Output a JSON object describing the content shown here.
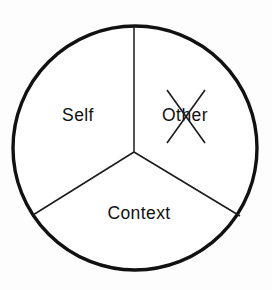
{
  "figure": {
    "background_color": "#fdfdfd",
    "stroke_color": "#111111",
    "fill_color": "#ffffff"
  },
  "circle": {
    "center_x": 135,
    "center_y": 148,
    "radius": 122,
    "stroke_width": 3.4
  },
  "sectors": [
    {
      "id": "self",
      "label": "Self",
      "label_x": 78,
      "label_y": 116,
      "struck_out": false,
      "start_angle_deg": 90,
      "end_angle_deg": 210
    },
    {
      "id": "other",
      "label": "Other",
      "label_x": 185,
      "label_y": 116,
      "struck_out": true,
      "start_angle_deg": 330,
      "end_angle_deg": 90
    },
    {
      "id": "context",
      "label": "Context",
      "label_x": 139,
      "label_y": 214,
      "struck_out": false,
      "start_angle_deg": 210,
      "end_angle_deg": 330
    }
  ],
  "spokes": [
    {
      "id": "spoke-top",
      "x1": 134,
      "y1": 152,
      "x2": 134,
      "y2": 25
    },
    {
      "id": "spoke-lower-left",
      "x1": 134,
      "y1": 152,
      "x2": 33,
      "y2": 215
    },
    {
      "id": "spoke-lower-right",
      "x1": 134,
      "y1": 152,
      "x2": 240,
      "y2": 216
    }
  ],
  "strikeout": {
    "target_sector": "other",
    "mark": "x-cross",
    "lines": [
      {
        "id": "strike-down",
        "x1": 167,
        "y1": 90,
        "x2": 205,
        "y2": 143
      },
      {
        "id": "strike-up",
        "x1": 205,
        "y1": 90,
        "x2": 167,
        "y2": 143
      }
    ]
  }
}
